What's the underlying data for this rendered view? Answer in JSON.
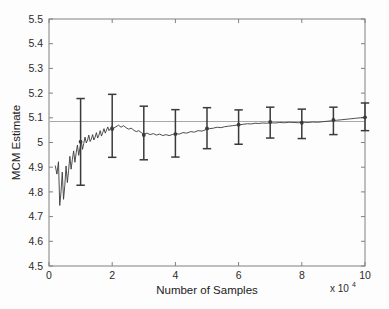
{
  "chart_data": {
    "type": "line",
    "title": "",
    "xlabel": "Number of Samples",
    "ylabel": "MCM Estimate",
    "x_exponent_label": "x 10",
    "x_exponent_value": "4",
    "xlim": [
      0,
      10
    ],
    "ylim": [
      4.5,
      5.5
    ],
    "xticks": [
      0,
      2,
      4,
      6,
      8,
      10
    ],
    "xticklabels": [
      "0",
      "2",
      "4",
      "6",
      "8",
      "10"
    ],
    "yticks": [
      4.5,
      4.6,
      4.7,
      4.8,
      4.9,
      5.0,
      5.1,
      5.2,
      5.3,
      5.4,
      5.5
    ],
    "yticklabels": [
      "4.5",
      "4.6",
      "4.7",
      "4.8",
      "4.9",
      "5",
      "5.1",
      "5.2",
      "5.3",
      "5.4",
      "5.5"
    ],
    "grid": false,
    "legend": null,
    "line_color": "#3a3a3a",
    "reference_line_color": "#a8a8a8",
    "axis_color": "#808080",
    "reference_line": {
      "label": "true value",
      "y": 5.085
    },
    "series": [
      {
        "name": "MCM running estimate",
        "type": "line",
        "x": [
          0.2,
          0.25,
          0.3,
          0.34,
          0.38,
          0.42,
          0.46,
          0.5,
          0.54,
          0.58,
          0.62,
          0.66,
          0.7,
          0.74,
          0.78,
          0.82,
          0.86,
          0.9,
          0.94,
          0.98,
          1.02,
          1.06,
          1.1,
          1.14,
          1.18,
          1.22,
          1.26,
          1.3,
          1.34,
          1.38,
          1.42,
          1.46,
          1.5,
          1.54,
          1.58,
          1.62,
          1.66,
          1.7,
          1.74,
          1.78,
          1.82,
          1.86,
          1.9,
          1.94,
          1.98,
          2.05,
          2.12,
          2.2,
          2.28,
          2.36,
          2.44,
          2.52,
          2.6,
          2.68,
          2.76,
          2.84,
          2.92,
          3.0,
          3.1,
          3.2,
          3.3,
          3.4,
          3.5,
          3.6,
          3.7,
          3.8,
          3.9,
          4.0,
          4.12,
          4.24,
          4.36,
          4.48,
          4.6,
          4.72,
          4.84,
          4.96,
          5.08,
          5.2,
          5.32,
          5.44,
          5.56,
          5.68,
          5.8,
          5.92,
          6.04,
          6.16,
          6.28,
          6.4,
          6.52,
          6.64,
          6.76,
          6.88,
          7.0,
          7.15,
          7.3,
          7.45,
          7.6,
          7.75,
          7.9,
          8.05,
          8.2,
          8.35,
          8.5,
          8.65,
          8.8,
          8.95,
          9.1,
          9.25,
          9.4,
          9.55,
          9.7,
          9.85,
          10.0
        ],
        "y": [
          4.905,
          4.872,
          4.922,
          4.745,
          4.8,
          4.88,
          4.77,
          4.826,
          4.905,
          4.838,
          4.886,
          4.944,
          4.892,
          4.932,
          4.966,
          4.92,
          4.958,
          4.99,
          4.948,
          4.978,
          5.006,
          4.972,
          4.996,
          5.022,
          4.998,
          5.01,
          5.03,
          5.004,
          5.014,
          5.032,
          5.01,
          5.022,
          5.04,
          5.018,
          5.03,
          5.048,
          5.026,
          5.04,
          5.056,
          5.038,
          5.05,
          5.063,
          5.048,
          5.056,
          5.066,
          5.058,
          5.064,
          5.07,
          5.062,
          5.068,
          5.06,
          5.054,
          5.058,
          5.05,
          5.044,
          5.048,
          5.04,
          5.034,
          5.038,
          5.032,
          5.036,
          5.03,
          5.034,
          5.028,
          5.032,
          5.028,
          5.032,
          5.036,
          5.034,
          5.04,
          5.038,
          5.044,
          5.042,
          5.048,
          5.046,
          5.052,
          5.056,
          5.058,
          5.062,
          5.06,
          5.064,
          5.066,
          5.068,
          5.07,
          5.072,
          5.074,
          5.076,
          5.075,
          5.078,
          5.077,
          5.079,
          5.078,
          5.08,
          5.079,
          5.081,
          5.08,
          5.082,
          5.081,
          5.08,
          5.082,
          5.081,
          5.083,
          5.082,
          5.084,
          5.086,
          5.088,
          5.09,
          5.092,
          5.094,
          5.096,
          5.098,
          5.1,
          5.102
        ]
      },
      {
        "name": "MCM estimate with 95% error bars",
        "type": "errorbar",
        "x": [
          1,
          2,
          3,
          4,
          5,
          6,
          7,
          8,
          9,
          10
        ],
        "y": [
          5.003,
          5.055,
          5.03,
          5.034,
          5.057,
          5.072,
          5.083,
          5.08,
          5.091,
          5.102
        ],
        "y_upper": [
          5.178,
          5.195,
          5.147,
          5.133,
          5.141,
          5.132,
          5.143,
          5.135,
          5.143,
          5.16
        ],
        "y_lower": [
          4.827,
          4.94,
          4.93,
          4.941,
          4.975,
          4.993,
          5.018,
          5.016,
          5.032,
          5.048
        ]
      }
    ]
  }
}
